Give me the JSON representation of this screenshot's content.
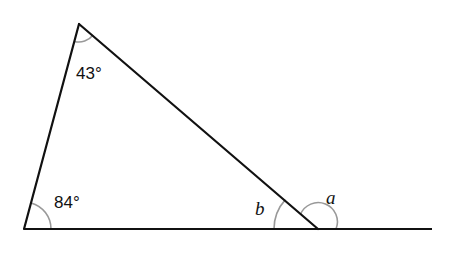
{
  "diagram": {
    "type": "triangle-exterior-angle",
    "colors": {
      "line": "#111111",
      "arc": "#999999",
      "background": "#ffffff"
    },
    "vertices": {
      "top": {
        "x": 79,
        "y": 24
      },
      "bottom_left": {
        "x": 24,
        "y": 229
      },
      "bottom_right": {
        "x": 318,
        "y": 229
      }
    },
    "baseline_end": {
      "x": 432,
      "y": 229
    },
    "angles": {
      "top": {
        "label": "43°",
        "value": 43
      },
      "bottom_left": {
        "label": "84°",
        "value": 84
      },
      "interior_b": {
        "label": "b"
      },
      "exterior_a": {
        "label": "a"
      }
    }
  }
}
